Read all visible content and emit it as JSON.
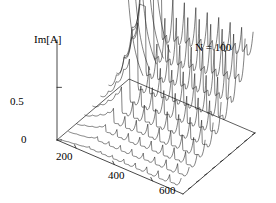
{
  "figure": {
    "kind": "3d-waterfall-plot",
    "background": "#ffffff",
    "line_color": "#1a1a1a",
    "axis_color": "#1a1a1a"
  },
  "annotation": {
    "text": "N = 100"
  },
  "axes": {
    "y": {
      "label": "Im[A]",
      "ticks": [
        "0.5",
        "0"
      ],
      "tick_values": [
        0.5,
        0
      ],
      "range": [
        0,
        0.95
      ]
    },
    "x": {
      "label": "",
      "ticks": [
        "200",
        "400",
        "600"
      ],
      "tick_values": [
        200,
        400,
        600
      ],
      "range": [
        100,
        760
      ]
    },
    "z": {
      "label": "",
      "ticks": [],
      "range": [
        0,
        9
      ]
    }
  },
  "chart_data": {
    "type": "line",
    "title": "",
    "subtitle": "",
    "xlabel": "",
    "ylabel": "Im[A]",
    "annotations": [
      "N = 100"
    ],
    "legend": [],
    "legend_position": "none",
    "grid": false,
    "xlim": [
      100,
      760
    ],
    "ylim": [
      0,
      0.95
    ],
    "projection": "3d-waterfall",
    "n_series": 10,
    "series": [
      {
        "name": "trace-0",
        "depth": 0,
        "x": [
          120,
          160,
          200,
          240,
          270,
          300,
          330,
          360,
          390,
          420,
          450,
          480,
          510,
          540,
          570,
          600,
          630,
          660,
          690,
          720,
          750
        ],
        "values": [
          0.02,
          0.03,
          0.04,
          0.05,
          0.07,
          0.05,
          0.07,
          0.05,
          0.08,
          0.05,
          0.09,
          0.05,
          0.1,
          0.05,
          0.11,
          0.05,
          0.12,
          0.05,
          0.13,
          0.06,
          0.14
        ]
      },
      {
        "name": "trace-1",
        "depth": 1,
        "x": [
          120,
          160,
          200,
          240,
          270,
          300,
          330,
          360,
          390,
          420,
          450,
          480,
          510,
          540,
          570,
          600,
          630,
          660,
          690,
          720,
          750
        ],
        "values": [
          0.03,
          0.04,
          0.05,
          0.07,
          0.1,
          0.06,
          0.1,
          0.06,
          0.11,
          0.06,
          0.12,
          0.06,
          0.13,
          0.07,
          0.14,
          0.07,
          0.16,
          0.07,
          0.17,
          0.08,
          0.18
        ]
      },
      {
        "name": "trace-2",
        "depth": 2,
        "x": [
          120,
          160,
          200,
          240,
          270,
          300,
          330,
          360,
          390,
          420,
          450,
          480,
          510,
          540,
          570,
          600,
          630,
          660,
          690,
          720,
          750
        ],
        "values": [
          0.04,
          0.06,
          0.08,
          0.11,
          0.15,
          0.08,
          0.15,
          0.08,
          0.16,
          0.08,
          0.17,
          0.09,
          0.18,
          0.09,
          0.19,
          0.09,
          0.21,
          0.1,
          0.22,
          0.1,
          0.24
        ]
      },
      {
        "name": "trace-3",
        "depth": 3,
        "x": [
          120,
          160,
          200,
          240,
          270,
          300,
          330,
          360,
          390,
          420,
          450,
          480,
          510,
          540,
          570,
          600,
          630,
          660,
          690,
          720,
          750
        ],
        "values": [
          0.06,
          0.09,
          0.13,
          0.18,
          0.24,
          0.1,
          0.21,
          0.1,
          0.22,
          0.11,
          0.23,
          0.11,
          0.24,
          0.11,
          0.26,
          0.12,
          0.27,
          0.12,
          0.29,
          0.13,
          0.31
        ]
      },
      {
        "name": "trace-4",
        "depth": 4,
        "x": [
          120,
          160,
          200,
          240,
          270,
          300,
          330,
          360,
          390,
          420,
          450,
          480,
          510,
          540,
          570,
          600,
          630,
          660,
          690,
          720,
          750
        ],
        "values": [
          0.08,
          0.13,
          0.2,
          0.29,
          0.38,
          0.13,
          0.28,
          0.13,
          0.3,
          0.14,
          0.31,
          0.14,
          0.33,
          0.15,
          0.35,
          0.15,
          0.37,
          0.16,
          0.39,
          0.16,
          0.41
        ]
      },
      {
        "name": "trace-5",
        "depth": 5,
        "x": [
          120,
          160,
          200,
          240,
          270,
          300,
          330,
          360,
          390,
          420,
          450,
          480,
          510,
          540,
          570,
          600,
          630,
          660,
          690,
          720,
          750
        ],
        "values": [
          0.11,
          0.19,
          0.31,
          0.46,
          0.58,
          0.17,
          0.37,
          0.17,
          0.4,
          0.18,
          0.42,
          0.19,
          0.44,
          0.19,
          0.46,
          0.2,
          0.49,
          0.21,
          0.51,
          0.22,
          0.54
        ]
      },
      {
        "name": "trace-6",
        "depth": 6,
        "x": [
          120,
          160,
          200,
          240,
          270,
          300,
          330,
          360,
          390,
          420,
          450,
          480,
          510,
          540,
          570,
          600,
          630,
          660,
          690,
          720,
          750
        ],
        "values": [
          0.15,
          0.28,
          0.48,
          0.7,
          0.86,
          0.22,
          0.49,
          0.23,
          0.52,
          0.24,
          0.55,
          0.25,
          0.58,
          0.26,
          0.61,
          0.27,
          0.64,
          0.28,
          0.67,
          0.29,
          0.7
        ]
      },
      {
        "name": "trace-7",
        "depth": 7,
        "x": [
          120,
          160,
          200,
          240,
          270,
          300,
          330,
          360,
          390,
          420,
          450,
          480,
          510,
          540,
          570,
          600,
          630,
          660,
          690,
          720,
          750
        ],
        "values": [
          0.2,
          0.4,
          0.7,
          0.95,
          0.95,
          0.29,
          0.64,
          0.3,
          0.68,
          0.32,
          0.72,
          0.33,
          0.75,
          0.35,
          0.79,
          0.36,
          0.82,
          0.38,
          0.86,
          0.39,
          0.9
        ]
      },
      {
        "name": "trace-8",
        "depth": 8,
        "x": [
          120,
          160,
          200,
          240,
          270,
          300,
          330,
          360,
          390,
          420,
          450,
          480,
          510,
          540,
          570,
          600,
          630,
          660,
          690,
          720,
          750
        ],
        "values": [
          0.28,
          0.58,
          0.95,
          0.95,
          0.95,
          0.38,
          0.82,
          0.4,
          0.87,
          0.42,
          0.92,
          0.44,
          0.95,
          0.46,
          0.95,
          0.48,
          0.95,
          0.5,
          0.95,
          0.52,
          0.95
        ]
      },
      {
        "name": "trace-9",
        "depth": 9,
        "x": [
          120,
          160,
          200,
          240,
          270,
          300,
          330,
          360,
          390,
          420,
          450,
          480,
          510,
          540,
          570,
          600,
          630,
          660,
          690,
          720,
          750
        ],
        "values": [
          0.4,
          0.85,
          0.95,
          0.95,
          0.95,
          0.5,
          0.95,
          0.53,
          0.95,
          0.56,
          0.95,
          0.59,
          0.95,
          0.62,
          0.95,
          0.65,
          0.95,
          0.68,
          0.95,
          0.71,
          0.95
        ]
      }
    ]
  }
}
